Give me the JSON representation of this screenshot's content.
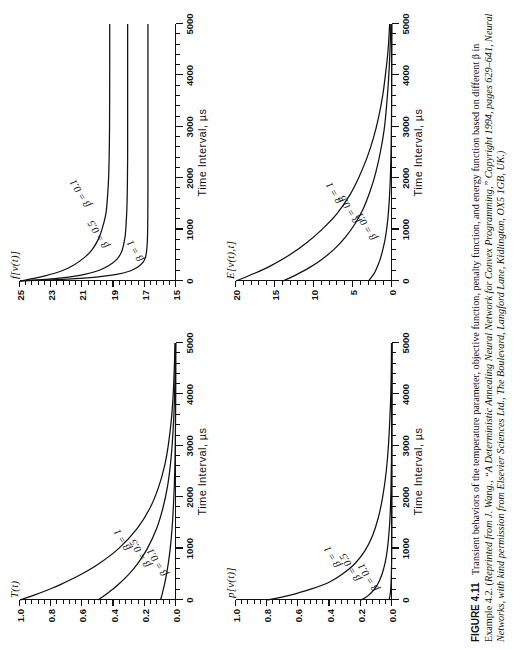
{
  "figure": {
    "number_label": "FIGURE 4.11",
    "caption_roman_1": "Transient behaviors of the temperature parameter, objective function, penalty function, and energy function based on different β in Example 4.2. (",
    "caption_italic": "Reprinted from J. Wang., “A Deterministic Annealing Neural Network for Convex Programming,” Copyright 1994, pages 629–641, Neural Networks, with kind permission from Elsevier Sciences Ltd., The Boulevard, Langford Lane, Kidlington, OX5 1GB, UK.)",
    "rotation_note": "90"
  },
  "common": {
    "xlabel": "Time  Interval, µs",
    "x_ticks": [
      "0",
      "1000",
      "2000",
      "3000",
      "4000",
      "5000"
    ],
    "x_values": [
      0,
      1000,
      2000,
      3000,
      4000,
      5000
    ],
    "series_names": [
      "β = 1",
      "β = 0.5",
      "β = 0.1"
    ]
  },
  "chart_data": [
    {
      "id": "temperature",
      "position": "top-left-of-page",
      "type": "line",
      "title": "",
      "ylabel": "T(t)",
      "xlabel": "Time  Interval, µs",
      "xlim": [
        0,
        5000
      ],
      "ylim": [
        0.0,
        1.0
      ],
      "y_ticks": [
        "0.0",
        "0.2",
        "0.4",
        "0.6",
        "0.8",
        "1.0"
      ],
      "y_values": [
        0.0,
        0.2,
        0.4,
        0.6,
        0.8,
        1.0
      ],
      "grid": false,
      "legend": "inline-annotations",
      "series": [
        {
          "name": "β = 1",
          "label_x": 1150,
          "label_y": 0.3,
          "x": [
            0,
            100,
            200,
            300,
            500,
            700,
            1000,
            1400,
            1800,
            2200,
            2600,
            3000,
            3500,
            4000,
            4500,
            5000
          ],
          "values": [
            1.0,
            0.905,
            0.819,
            0.741,
            0.607,
            0.497,
            0.368,
            0.247,
            0.165,
            0.111,
            0.074,
            0.05,
            0.03,
            0.018,
            0.011,
            0.0067
          ]
        },
        {
          "name": "β = 0.5",
          "label_x": 900,
          "label_y": 0.175,
          "x": [
            0,
            100,
            200,
            300,
            500,
            700,
            1000,
            1400,
            1800,
            2200,
            2600,
            3000,
            3500,
            4000,
            4500,
            5000
          ],
          "values": [
            0.5,
            0.452,
            0.41,
            0.37,
            0.303,
            0.248,
            0.184,
            0.123,
            0.083,
            0.055,
            0.037,
            0.025,
            0.015,
            0.009,
            0.0055,
            0.0033
          ]
        },
        {
          "name": "β = 0.1",
          "label_x": 720,
          "label_y": 0.065,
          "x": [
            0,
            100,
            200,
            300,
            500,
            700,
            1000,
            1400,
            1800,
            2200,
            2600,
            3000,
            3500,
            4000,
            4500,
            5000
          ],
          "values": [
            0.1,
            0.09,
            0.082,
            0.074,
            0.061,
            0.05,
            0.037,
            0.025,
            0.017,
            0.011,
            0.0074,
            0.005,
            0.003,
            0.0018,
            0.0011,
            0.0007
          ]
        }
      ]
    },
    {
      "id": "objective-function",
      "position": "top-right-of-page",
      "type": "line",
      "title": "",
      "ylabel": "f[v(t)]",
      "xlabel": "Time  Interval, µs",
      "xlim": [
        0,
        5000
      ],
      "ylim": [
        15,
        25
      ],
      "y_ticks": [
        "15",
        "17",
        "19",
        "21",
        "23",
        "25"
      ],
      "y_values": [
        15,
        17,
        19,
        21,
        23,
        25
      ],
      "grid": false,
      "legend": "inline-annotations",
      "series": [
        {
          "name": "β = 0.1",
          "label_x": 1700,
          "label_y": 20.6,
          "x": [
            0,
            50,
            100,
            200,
            300,
            450,
            600,
            800,
            1000,
            1300,
            1600,
            2000,
            2500,
            3000,
            4000,
            5000
          ],
          "values": [
            25.0,
            24.1,
            23.4,
            22.3,
            21.6,
            20.9,
            20.4,
            20.0,
            19.75,
            19.5,
            19.4,
            19.32,
            19.28,
            19.26,
            19.25,
            19.25
          ]
        },
        {
          "name": "β = 0.5",
          "label_x": 900,
          "label_y": 19.4,
          "x": [
            0,
            30,
            60,
            120,
            200,
            300,
            420,
            560,
            720,
            900,
            1100,
            1400,
            1800,
            2400,
            3500,
            5000
          ],
          "values": [
            25.0,
            23.4,
            22.3,
            21.0,
            20.0,
            19.3,
            18.8,
            18.5,
            18.35,
            18.25,
            18.2,
            18.15,
            18.12,
            18.1,
            18.1,
            18.1
          ]
        },
        {
          "name": "β = 1",
          "label_x": 560,
          "label_y": 17.2,
          "x": [
            0,
            20,
            40,
            80,
            130,
            200,
            280,
            370,
            470,
            600,
            750,
            950,
            1200,
            1700,
            3000,
            5000
          ],
          "values": [
            25.0,
            23.0,
            21.7,
            20.0,
            18.8,
            17.9,
            17.4,
            17.1,
            16.95,
            16.88,
            16.84,
            16.82,
            16.81,
            16.8,
            16.8,
            16.8
          ]
        }
      ]
    },
    {
      "id": "penalty-function",
      "position": "bottom-left-of-page",
      "type": "line",
      "title": "",
      "ylabel": "p[v(t)]",
      "xlabel": "Time  Interval, µs",
      "xlim": [
        0,
        5000
      ],
      "ylim": [
        0.0,
        1.0
      ],
      "y_ticks": [
        "0.0",
        "0.2",
        "0.4",
        "0.6",
        "0.8",
        "1.0"
      ],
      "y_values": [
        0.0,
        0.2,
        0.4,
        0.6,
        0.8,
        1.0
      ],
      "grid": false,
      "legend": "inline-annotations",
      "series": [
        {
          "name": "β = 1",
          "label_x": 820,
          "label_y": 0.34,
          "x": [
            0,
            60,
            120,
            220,
            350,
            500,
            700,
            950,
            1250,
            1600,
            2000,
            2500,
            3000,
            3800,
            4400,
            5000
          ],
          "values": [
            0.8,
            0.7,
            0.62,
            0.51,
            0.4,
            0.32,
            0.24,
            0.175,
            0.125,
            0.088,
            0.06,
            0.037,
            0.023,
            0.01,
            0.005,
            0.003
          ]
        },
        {
          "name": "β = 0.5",
          "label_x": 620,
          "label_y": 0.21,
          "x": [
            0,
            40,
            80,
            150,
            250,
            380,
            540,
            740,
            980,
            1280,
            1650,
            2100,
            2700,
            3400,
            4200,
            5000
          ],
          "values": [
            0.2,
            0.175,
            0.155,
            0.13,
            0.103,
            0.08,
            0.06,
            0.043,
            0.03,
            0.02,
            0.012,
            0.007,
            0.0035,
            0.0018,
            0.0008,
            0.0004
          ]
        },
        {
          "name": "β = 0.1",
          "label_x": 430,
          "label_y": 0.095,
          "x": [
            0,
            25,
            55,
            100,
            170,
            260,
            380,
            530,
            720,
            960,
            1260,
            1650,
            2200,
            3000,
            4000,
            5000
          ],
          "values": [
            0.02,
            0.017,
            0.015,
            0.012,
            0.0095,
            0.0072,
            0.0053,
            0.0037,
            0.0025,
            0.0016,
            0.0009,
            0.0005,
            0.0002,
            0.0001,
            5e-05,
            2e-05
          ]
        }
      ]
    },
    {
      "id": "energy-function",
      "position": "bottom-right-of-page",
      "type": "line",
      "title": "",
      "ylabel": "E[v(t),t]",
      "xlabel": "Time  Interval, µs",
      "xlim": [
        0,
        5000
      ],
      "ylim": [
        0,
        20
      ],
      "y_ticks": [
        "0",
        "5",
        "10",
        "15",
        "20"
      ],
      "y_values": [
        0,
        5,
        10,
        15,
        20
      ],
      "grid": false,
      "legend": "inline-annotations",
      "series": [
        {
          "name": "β = 1",
          "label_x": 1700,
          "label_y": 6.6,
          "x": [
            0,
            150,
            300,
            500,
            750,
            1000,
            1300,
            1650,
            2000,
            2400,
            2800,
            3200,
            3600,
            4000,
            4500,
            5000
          ],
          "values": [
            20.0,
            17.6,
            15.5,
            13.2,
            10.9,
            9.0,
            7.1,
            5.5,
            4.3,
            3.2,
            2.35,
            1.7,
            1.2,
            0.85,
            0.5,
            0.3
          ]
        },
        {
          "name": "β = 0.5",
          "label_x": 1380,
          "label_y": 4.4,
          "x": [
            0,
            120,
            250,
            420,
            620,
            850,
            1100,
            1400,
            1750,
            2100,
            2500,
            2950,
            3400,
            3900,
            4400,
            5000
          ],
          "values": [
            14.0,
            12.3,
            10.7,
            9.0,
            7.4,
            6.0,
            4.8,
            3.7,
            2.8,
            2.1,
            1.5,
            1.0,
            0.7,
            0.45,
            0.28,
            0.15
          ]
        },
        {
          "name": "β = 0.1",
          "label_x": 1050,
          "label_y": 2.2,
          "x": [
            0,
            80,
            170,
            290,
            430,
            600,
            800,
            1050,
            1350,
            1700,
            2100,
            2550,
            3050,
            3600,
            4300,
            5000
          ],
          "values": [
            3.0,
            2.6,
            2.2,
            1.85,
            1.5,
            1.2,
            0.9,
            0.65,
            0.45,
            0.3,
            0.19,
            0.12,
            0.07,
            0.04,
            0.02,
            0.01
          ]
        }
      ]
    }
  ]
}
